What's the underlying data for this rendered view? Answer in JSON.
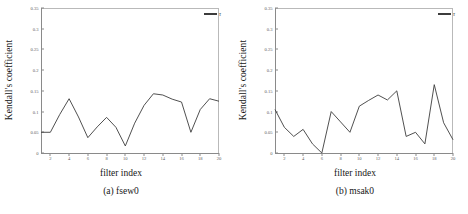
{
  "figure": {
    "panels": [
      {
        "caption": "(a) fsew0",
        "xlabel": "filter index",
        "ylabel": "Kendall's coefficient",
        "legend_label": "τ"
      },
      {
        "caption": "(b) msak0",
        "xlabel": "filter index",
        "ylabel": "Kendall's coefficient",
        "legend_label": "τ"
      }
    ]
  },
  "chart_data": [
    {
      "type": "line",
      "title": "(a) fsew0",
      "xlabel": "filter index",
      "ylabel": "Kendall's coefficient",
      "xlim": [
        1,
        20
      ],
      "ylim": [
        0,
        0.35
      ],
      "xticks": [
        2,
        4,
        6,
        8,
        10,
        12,
        14,
        16,
        18,
        20
      ],
      "xticklabels": [
        "2",
        "4",
        "6",
        "8",
        "10",
        "12",
        "14",
        "16",
        "18",
        "20"
      ],
      "yticks": [
        0,
        0.05,
        0.1,
        0.15,
        0.2,
        0.25,
        0.3,
        0.35
      ],
      "yticklabels": [
        "0",
        "0.05",
        "0.1",
        "0.15",
        "0.2",
        "0.25",
        "0.3",
        "0.35"
      ],
      "grid": false,
      "legend": [
        "τ"
      ],
      "legend_position": "top-right",
      "line_color": "#3c3c3c",
      "x": [
        1,
        2,
        3,
        4,
        5,
        6,
        7,
        8,
        9,
        10,
        11,
        12,
        13,
        14,
        15,
        16,
        17,
        18,
        19,
        20
      ],
      "series": [
        {
          "name": "τ",
          "values": [
            0.05,
            0.05,
            0.093,
            0.131,
            0.087,
            0.037,
            0.063,
            0.086,
            0.062,
            0.017,
            0.072,
            0.115,
            0.143,
            0.14,
            0.13,
            0.123,
            0.05,
            0.105,
            0.131,
            0.125
          ]
        }
      ]
    },
    {
      "type": "line",
      "title": "(b) msak0",
      "xlabel": "filter index",
      "ylabel": "Kendall's coefficient",
      "xlim": [
        1,
        20
      ],
      "ylim": [
        0,
        0.35
      ],
      "xticks": [
        2,
        4,
        6,
        8,
        10,
        12,
        14,
        16,
        18,
        20
      ],
      "xticklabels": [
        "2",
        "4",
        "6",
        "8",
        "10",
        "12",
        "14",
        "16",
        "18",
        "20"
      ],
      "yticks": [
        0,
        0.05,
        0.1,
        0.15,
        0.2,
        0.25,
        0.3,
        0.35
      ],
      "yticklabels": [
        "0",
        "0.05",
        "0.1",
        "0.15",
        "0.2",
        "0.25",
        "0.3",
        "0.35"
      ],
      "grid": false,
      "legend": [
        "τ"
      ],
      "legend_position": "top-right",
      "line_color": "#3c3c3c",
      "x": [
        1,
        2,
        3,
        4,
        5,
        6,
        7,
        8,
        9,
        10,
        11,
        12,
        13,
        14,
        15,
        16,
        17,
        18,
        19,
        20
      ],
      "series": [
        {
          "name": "τ",
          "values": [
            0.105,
            0.062,
            0.04,
            0.057,
            0.022,
            0.0,
            0.1,
            0.075,
            0.05,
            0.113,
            0.127,
            0.14,
            0.128,
            0.15,
            0.04,
            0.05,
            0.022,
            0.165,
            0.073,
            0.032
          ]
        }
      ]
    }
  ]
}
